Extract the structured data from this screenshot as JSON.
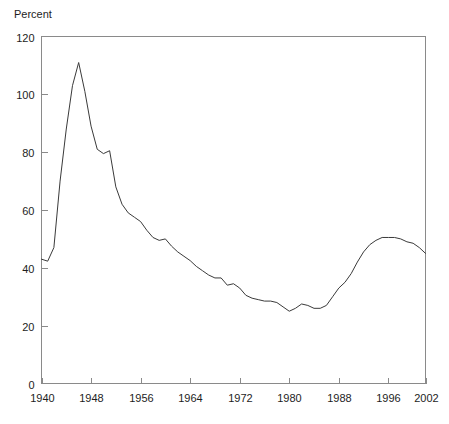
{
  "chart_data": {
    "type": "line",
    "title": "",
    "subtitle": "",
    "ylabel": "Percent",
    "xlabel": "",
    "grid": false,
    "legend": null,
    "xlim": [
      1940,
      2002
    ],
    "ylim": [
      0,
      120
    ],
    "y_ticks": [
      0,
      20,
      40,
      60,
      80,
      100,
      120
    ],
    "x_ticks": [
      1940,
      1948,
      1956,
      1964,
      1972,
      1980,
      1988,
      1996,
      2002
    ],
    "x_tick_labels": [
      "1940",
      "1948",
      "1956",
      "1964",
      "1972",
      "1980",
      "1988",
      "1996",
      "2002"
    ],
    "y_tick_labels": [
      "0",
      "20",
      "40",
      "60",
      "80",
      "100",
      "120"
    ],
    "series": [
      {
        "name": "Percent",
        "color": "#3a3a3a",
        "x": [
          1940,
          1941,
          1942,
          1943,
          1944,
          1945,
          1946,
          1947,
          1948,
          1949,
          1950,
          1951,
          1952,
          1953,
          1954,
          1955,
          1956,
          1957,
          1958,
          1959,
          1960,
          1961,
          1962,
          1963,
          1964,
          1965,
          1966,
          1967,
          1968,
          1969,
          1970,
          1971,
          1972,
          1973,
          1974,
          1975,
          1976,
          1977,
          1978,
          1979,
          1980,
          1981,
          1982,
          1983,
          1984,
          1985,
          1986,
          1987,
          1988,
          1989,
          1990,
          1991,
          1992,
          1993,
          1994,
          1995,
          1996,
          1997,
          1998,
          1999,
          2000,
          2001,
          2002
        ],
        "y": [
          43.0,
          42.3,
          47.0,
          70.0,
          88.0,
          103.0,
          111.0,
          101.0,
          89.0,
          81.0,
          79.5,
          80.5,
          68.0,
          62.0,
          59.0,
          57.5,
          56.0,
          53.0,
          50.5,
          49.5,
          50.0,
          47.5,
          45.5,
          44.0,
          42.5,
          40.5,
          39.0,
          37.5,
          36.5,
          36.5,
          34.0,
          34.5,
          33.0,
          30.5,
          29.5,
          29.0,
          28.5,
          28.5,
          28.0,
          26.5,
          25.0,
          26.0,
          27.5,
          27.0,
          26.0,
          26.0,
          27.0,
          30.0,
          33.0,
          35.0,
          38.0,
          42.0,
          45.5,
          48.0,
          49.5,
          50.5,
          50.5,
          50.5,
          50.0,
          49.0,
          48.5,
          47.0,
          45.0
        ]
      }
    ]
  }
}
